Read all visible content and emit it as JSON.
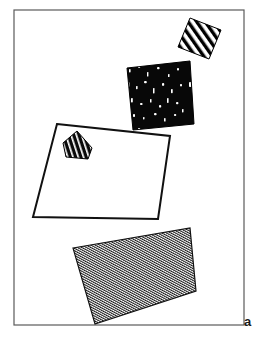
{
  "figure": {
    "panel_label": "a",
    "panel_label_position": {
      "x": 244,
      "y": 315
    },
    "background_color": "#ffffff",
    "frame": {
      "name": "panel-border",
      "x": 14,
      "y": 10,
      "width": 230,
      "height": 315,
      "stroke_color": "#5a5a5a",
      "stroke_width": 1.2,
      "fill": "none"
    },
    "shapes": [
      {
        "id": "shape-hatched-small-top",
        "label": "small coarse-hatched parallelogram",
        "fill_pattern": "coarse-diagonal-hatch",
        "fill_color": "#000000",
        "stroke_color": "#000000",
        "stroke_width": 1,
        "points": "190,18 221,30 209,59 178,47"
      },
      {
        "id": "shape-black-speckled",
        "label": "black rectangle with white speckles",
        "fill_pattern": "black-with-white-speckles",
        "fill_color": "#0a0a0a",
        "stroke_color": "#000000",
        "stroke_width": 1,
        "points": "127,68 190,61 194,124 133,130"
      },
      {
        "id": "shape-white-quad",
        "label": "large white outlined quadrilateral",
        "fill_pattern": "solid-white",
        "fill_color": "#ffffff",
        "stroke_color": "#111111",
        "stroke_width": 2,
        "points": "57,124 170,136 158,219 33,217"
      },
      {
        "id": "shape-striped-pentagon",
        "label": "small dark pentagon with white stripes",
        "fill_pattern": "white-stripes-on-black",
        "fill_color": "#0a0a0a",
        "stroke_color": "#000000",
        "stroke_width": 1,
        "points": "77,131 92,148 88,159 66,157 63,143"
      },
      {
        "id": "shape-fine-hatched-bottom",
        "label": "large fine-hatched quadrilateral",
        "fill_pattern": "fine-diagonal-hatch",
        "fill_color": "#222222",
        "stroke_color": "#111111",
        "stroke_width": 1.2,
        "points": "73,248 190,228 196,291 95,324"
      }
    ]
  }
}
